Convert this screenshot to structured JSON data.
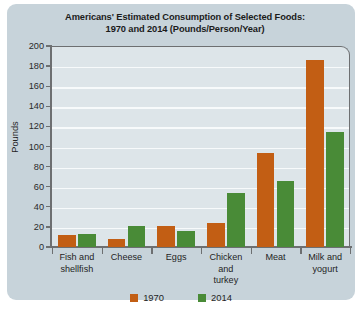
{
  "chart_data": {
    "type": "bar",
    "title": "Americans' Estimated Consumption of Selected Foods: 1970 and 2014 (Pounds/Person/Year)",
    "title_line1": "Americans' Estimated Consumption of Selected Foods:",
    "title_line2": "1970 and 2014 (Pounds/Person/Year)",
    "xlabel": "",
    "ylabel": "Pounds",
    "ylim": [
      0,
      200
    ],
    "ytick_step": 20,
    "yticks": [
      0,
      20,
      40,
      60,
      80,
      100,
      120,
      140,
      160,
      180,
      200
    ],
    "grid": true,
    "legend_position": "bottom",
    "categories": [
      "Fish and shellfish",
      "Cheese",
      "Eggs",
      "Chicken and turkey",
      "Meat",
      "Milk and yogurt"
    ],
    "category_lines": [
      [
        "Fish and",
        "shellfish"
      ],
      [
        "Cheese"
      ],
      [
        "Eggs"
      ],
      [
        "Chicken",
        "and",
        "turkey"
      ],
      [
        "Meat"
      ],
      [
        "Milk and",
        "yogurt"
      ]
    ],
    "series": [
      {
        "name": "1970",
        "color": "#c25e14",
        "values": [
          12,
          8,
          21,
          24,
          94,
          186
        ]
      },
      {
        "name": "2014",
        "color": "#498b37",
        "values": [
          13,
          21,
          16,
          54,
          66,
          114
        ]
      }
    ]
  },
  "legend": {
    "items": [
      {
        "label": "1970",
        "color": "#c25e14"
      },
      {
        "label": "2014",
        "color": "#498b37"
      }
    ]
  },
  "colors": {
    "card_background": "#c7d3da",
    "plot_background": "#dde5e9",
    "gridline": "#f7fafb",
    "axis": "#6d6f71",
    "series_1970": "#c25e14",
    "series_2014": "#498b37",
    "text": "#1f1f1f"
  }
}
